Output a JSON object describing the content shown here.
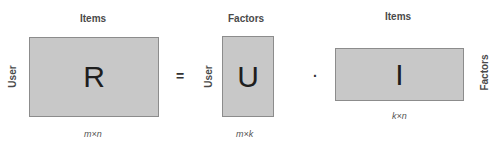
{
  "diagram": {
    "type": "matrix-factorization",
    "operators": {
      "equals": "=",
      "dot": "·"
    },
    "matrices": [
      {
        "id": "R",
        "letter": "R",
        "top_label": "Items",
        "side_label": "User",
        "dims": "m×n"
      },
      {
        "id": "U",
        "letter": "U",
        "top_label": "Factors",
        "side_label": "User",
        "dims": "m×k"
      },
      {
        "id": "I",
        "letter": "I",
        "top_label": "Items",
        "side_label": "Factors",
        "dims": "k×n"
      }
    ],
    "colors": {
      "box_fill": "#c8c8c8",
      "box_border": "#8c8c8c",
      "text": "#1e1e1e"
    }
  }
}
